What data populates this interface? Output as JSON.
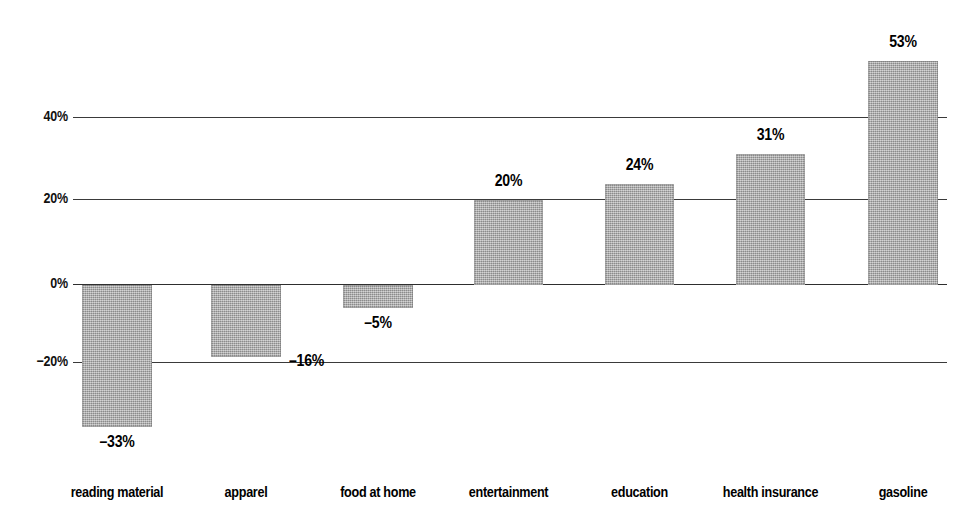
{
  "chart_data": {
    "type": "bar",
    "title": "",
    "subtitle": "",
    "xlabel": "",
    "ylabel": "",
    "ylim": [
      -40,
      60
    ],
    "grid": true,
    "legend": null,
    "orientation": "vertical",
    "baseline": 0,
    "categories": [
      "reading material",
      "apparel",
      "food at home",
      "entertainment",
      "education",
      "health insurance",
      "gasoline"
    ],
    "values": [
      -33,
      -16,
      -5,
      20,
      24,
      31,
      53
    ],
    "data_labels": [
      "–33%",
      "–16%",
      "–5%",
      "20%",
      "24%",
      "31%",
      "53%"
    ],
    "ytick_values": [
      40,
      20,
      0,
      -20
    ],
    "ytick_labels": [
      "40%",
      "20%",
      "0%",
      "−20%"
    ],
    "bar_color": "#aaaaaa",
    "gridline_color": "#3a3a3a",
    "text_color": "#000000",
    "background_color": "#ffffff"
  },
  "axis": {
    "ticks": [
      {
        "label": "40%",
        "value": 40,
        "y": 117
      },
      {
        "label": "20%",
        "value": 20,
        "y": 199
      },
      {
        "label": "0%",
        "value": 0,
        "y": 284
      },
      {
        "label": "−20%",
        "value": -20,
        "y": 362
      }
    ]
  },
  "bars": [
    {
      "category": "reading material",
      "value": -33,
      "label": "–33%",
      "label_position": "below",
      "x": 82,
      "width": 70,
      "top": 285,
      "height": 142,
      "label_x": 82,
      "label_y": 433,
      "cat_x": 82,
      "cat_y": 484
    },
    {
      "category": "apparel",
      "value": -16,
      "label": "–16%",
      "label_position": "right",
      "x": 211,
      "width": 70,
      "top": 285,
      "height": 72,
      "label_x": 289,
      "label_y": 352,
      "cat_x": 211,
      "cat_y": 484
    },
    {
      "category": "food at home",
      "value": -5,
      "label": "–5%",
      "label_position": "below",
      "x": 343,
      "width": 70,
      "top": 285,
      "height": 23,
      "label_x": 343,
      "label_y": 314,
      "cat_x": 343,
      "cat_y": 484
    },
    {
      "category": "entertainment",
      "value": 20,
      "label": "20%",
      "label_position": "above",
      "x": 474,
      "width": 69,
      "top": 200,
      "height": 85,
      "label_x": 474,
      "label_y": 172,
      "cat_x": 474,
      "cat_y": 484
    },
    {
      "category": "education",
      "value": 24,
      "label": "24%",
      "label_position": "above",
      "x": 605,
      "width": 69,
      "top": 184,
      "height": 101,
      "label_x": 605,
      "label_y": 156,
      "cat_x": 605,
      "cat_y": 484
    },
    {
      "category": "health insurance",
      "value": 31,
      "label": "31%",
      "label_position": "above",
      "x": 736,
      "width": 69,
      "top": 154,
      "height": 131,
      "label_x": 736,
      "label_y": 126,
      "cat_x": 736,
      "cat_y": 484
    },
    {
      "category": "gasoline",
      "value": 53,
      "label": "53%",
      "label_position": "above",
      "x": 868,
      "width": 70,
      "top": 61,
      "height": 224,
      "label_x": 868,
      "label_y": 33,
      "cat_x": 868,
      "cat_y": 484
    }
  ],
  "geometry": {
    "grid_left": 73,
    "grid_right": 947,
    "ytick_right": 68
  }
}
